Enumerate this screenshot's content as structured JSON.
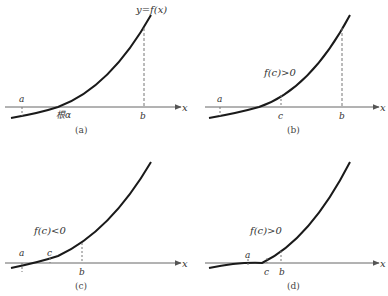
{
  "figure": {
    "panels": [
      {
        "id": "a",
        "caption": "(a)",
        "axis_label": "x",
        "curve_label": "y=f(x)",
        "point_labels": {
          "a": "a",
          "root": "根α",
          "b": "b"
        }
      },
      {
        "id": "b",
        "caption": "(b)",
        "axis_label": "x",
        "annotation": "f(c)>0",
        "point_labels": {
          "a": "a",
          "c": "c",
          "b": "b"
        }
      },
      {
        "id": "c",
        "caption": "(c)",
        "axis_label": "x",
        "annotation": "f(c)<0",
        "point_labels": {
          "a": "a",
          "c": "c",
          "b": "b"
        }
      },
      {
        "id": "d",
        "caption": "(d)",
        "axis_label": "x",
        "annotation": "f(c)>0",
        "point_labels": {
          "a": "a",
          "c": "c",
          "b": "b"
        }
      }
    ],
    "colors": {
      "curve": "#1a1a1a",
      "axis": "#555555",
      "dashed": "#777777",
      "text": "#333333"
    }
  }
}
